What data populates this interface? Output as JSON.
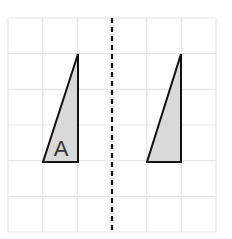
{
  "diagram": {
    "type": "reflection-grid",
    "grid": {
      "columns": 6,
      "rows": 6,
      "x0": 8,
      "y0": 18,
      "x1": 216,
      "y1": 232,
      "line_color": "#e6e6e6"
    },
    "mirror_line": {
      "x": 112,
      "y0": 18,
      "y1": 232,
      "style": "dashed",
      "color": "#111111"
    },
    "shapes": [
      {
        "name": "triangle-a",
        "label": "A",
        "points": "78,54 43,162 78,162",
        "fill": "#d9d9d9",
        "stroke": "#111111"
      },
      {
        "name": "triangle-reflected",
        "label": "",
        "points": "181,54 147,162 181,162",
        "fill": "#d9d9d9",
        "stroke": "#111111"
      }
    ],
    "label_a": {
      "text": "A",
      "x": 61,
      "y": 156
    }
  }
}
